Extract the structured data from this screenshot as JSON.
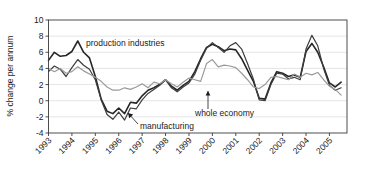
{
  "chart_data": {
    "type": "line",
    "title": "",
    "xlabel": "",
    "ylabel": "% change per annum",
    "ylim": [
      -4,
      10
    ],
    "yticks": [
      -4,
      -2,
      0,
      2,
      4,
      6,
      8,
      10
    ],
    "ytick_labels": [
      "-4",
      "-2",
      "0",
      "2",
      "4",
      "6",
      "8",
      "10"
    ],
    "xlim": [
      1993.0,
      2005.75
    ],
    "xticks": [
      1993,
      1994,
      1995,
      1996,
      1997,
      1998,
      1999,
      2000,
      2001,
      2002,
      2003,
      2004,
      2005
    ],
    "xtick_labels": [
      "1993",
      "1994",
      "1995",
      "1996",
      "1997",
      "1998",
      "1999",
      "2000",
      "2001",
      "2002",
      "2003",
      "2004",
      "2005"
    ],
    "grid": true,
    "grid_axis": "y",
    "legend": "inline-annotations",
    "x": [
      1993.0,
      1993.25,
      1993.5,
      1993.75,
      1994.0,
      1994.25,
      1994.5,
      1994.75,
      1995.0,
      1995.25,
      1995.5,
      1995.75,
      1996.0,
      1996.25,
      1996.5,
      1996.75,
      1997.0,
      1997.25,
      1997.5,
      1997.75,
      1998.0,
      1998.25,
      1998.5,
      1998.75,
      1999.0,
      1999.25,
      1999.5,
      1999.75,
      2000.0,
      2000.25,
      2000.5,
      2000.75,
      2001.0,
      2001.25,
      2001.5,
      2001.75,
      2002.0,
      2002.25,
      2002.5,
      2002.75,
      2003.0,
      2003.25,
      2003.5,
      2003.75,
      2004.0,
      2004.25,
      2004.5,
      2004.75,
      2005.0,
      2005.25,
      2005.5
    ],
    "series": [
      {
        "name": "production industries",
        "color": "#262626",
        "width": 1.6,
        "values": [
          5.0,
          6.0,
          5.5,
          5.6,
          6.1,
          7.4,
          6.0,
          5.3,
          3.0,
          0.2,
          -1.3,
          -1.6,
          -0.9,
          -1.6,
          -0.2,
          -0.3,
          0.6,
          1.3,
          1.6,
          2.0,
          2.6,
          1.8,
          1.3,
          1.9,
          2.4,
          3.6,
          5.2,
          6.6,
          7.0,
          6.7,
          6.2,
          6.4,
          6.3,
          5.2,
          3.8,
          2.4,
          0.3,
          0.2,
          2.2,
          3.6,
          3.4,
          3.0,
          3.2,
          2.9,
          6.1,
          7.1,
          6.0,
          4.2,
          2.2,
          1.7,
          2.3
        ]
      },
      {
        "name": "manufacturing",
        "color": "#3d3d3d",
        "width": 1.2,
        "values": [
          3.6,
          4.3,
          3.9,
          3.0,
          4.1,
          5.1,
          4.4,
          3.9,
          2.6,
          0.1,
          -1.7,
          -2.3,
          -1.4,
          -2.4,
          -0.9,
          -1.0,
          0.1,
          0.9,
          1.4,
          1.9,
          2.6,
          1.6,
          1.1,
          1.7,
          2.2,
          3.3,
          5.0,
          6.5,
          7.2,
          6.6,
          6.0,
          6.8,
          7.2,
          6.4,
          4.6,
          2.7,
          0.1,
          0.0,
          2.0,
          3.4,
          3.3,
          2.7,
          2.9,
          2.6,
          6.4,
          8.1,
          6.8,
          4.0,
          1.9,
          1.3,
          1.6
        ]
      },
      {
        "name": "whole economy",
        "color": "#9a9a9a",
        "width": 1.2,
        "values": [
          4.0,
          3.6,
          4.0,
          3.4,
          3.6,
          4.2,
          3.7,
          3.3,
          2.9,
          2.4,
          1.7,
          1.3,
          1.3,
          1.6,
          1.4,
          1.7,
          2.1,
          1.6,
          2.3,
          2.1,
          2.6,
          2.1,
          1.7,
          2.3,
          2.8,
          2.6,
          2.4,
          4.6,
          5.1,
          4.2,
          4.4,
          4.3,
          4.1,
          3.4,
          2.6,
          1.7,
          1.5,
          2.0,
          2.9,
          3.0,
          2.8,
          2.6,
          3.3,
          2.9,
          3.4,
          3.2,
          3.5,
          2.6,
          1.8,
          1.4,
          0.7
        ]
      }
    ],
    "annotations": [
      {
        "name": "production-industries",
        "text": "production industries",
        "x_px": 86,
        "y_px": 46,
        "anchor": "start",
        "leader": null
      },
      {
        "name": "manufacturing",
        "text": "manufacturing",
        "x_px": 140,
        "y_px": 129,
        "anchor": "start",
        "leader": {
          "x1": 138,
          "y1": 124,
          "x2": 128,
          "y2": 113,
          "arrow": "up-left"
        }
      },
      {
        "name": "whole-economy",
        "text": "whole economy",
        "x_px": 195,
        "y_px": 116,
        "anchor": "start",
        "leader": {
          "x1": 208,
          "y1": 109,
          "x2": 208,
          "y2": 91,
          "arrow": "up"
        }
      }
    ]
  }
}
